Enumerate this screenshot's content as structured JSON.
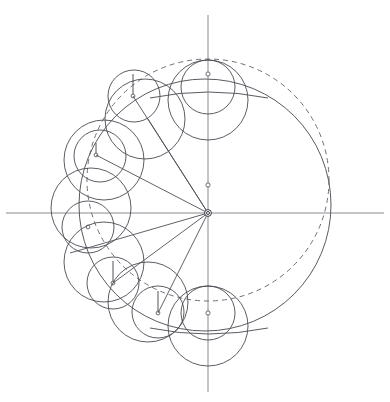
{
  "figure": {
    "canvas": {
      "width": 390,
      "height": 402
    },
    "origin": {
      "x": 208,
      "y": 213
    },
    "colors": {
      "axis": "#8a8a90",
      "dashed_guide": "#6f6f78",
      "solid_guide": "#5a5a62",
      "circle": "#4a4a52",
      "spoke": "#4f4f58",
      "background": "#ffffff"
    },
    "axes": {
      "x_axis": {
        "x1": 6,
        "y1": 213,
        "x2": 384,
        "y2": 213
      },
      "y_axis": {
        "x1": 208,
        "y1": 15,
        "x2": 208,
        "y2": 392
      }
    },
    "axis_marker_dot": {
      "x": 208,
      "y": 185,
      "r": 2.1
    },
    "origin_marker": {
      "x": 208,
      "y": 213,
      "r_outer": 3.4,
      "r_inner": 1.5
    },
    "dashed_guide_circle": {
      "cx": 208,
      "cy": 180,
      "r": 121,
      "style": "dashed"
    },
    "solid_guide_circle": {
      "cx": 205,
      "cy": 205,
      "r": 126,
      "style": "solid"
    },
    "rolling_circles": [
      {
        "id": "pos-0",
        "angle_deg": 90,
        "cx": 208,
        "cy": 100,
        "r": 40,
        "inner_cx": 208,
        "inner_cy": 87,
        "inner_r": 27,
        "dot_x": 208,
        "dot_y": 74,
        "radius_to_x": 208,
        "radius_to_y": 60
      },
      {
        "id": "pos-1",
        "angle_deg": 125,
        "cx": 145,
        "cy": 119,
        "r": 40,
        "inner_cx": 134,
        "inner_cy": 96,
        "inner_r": 26,
        "dot_x": 133,
        "dot_y": 96,
        "radius_to_x": 133,
        "radius_to_y": 74
      },
      {
        "id": "pos-2",
        "angle_deg": 155,
        "cx": 104,
        "cy": 160,
        "r": 40,
        "inner_cx": 100,
        "inner_cy": 156,
        "inner_r": 26,
        "dot_x": 96,
        "dot_y": 155,
        "radius_to_x": 96,
        "radius_to_y": 143
      },
      {
        "id": "pos-3",
        "angle_deg": 180,
        "cx": 91,
        "cy": 208,
        "r": 40,
        "inner_cx": 88,
        "inner_cy": 227,
        "inner_r": 26,
        "dot_x": 88,
        "dot_y": 227,
        "radius_to_x": 88,
        "radius_to_y": 227
      },
      {
        "id": "pos-4",
        "angle_deg": 205,
        "cx": 104,
        "cy": 262,
        "r": 40,
        "inner_cx": 113,
        "inner_cy": 283,
        "inner_r": 26,
        "dot_x": 113,
        "dot_y": 283,
        "radius_to_x": 113,
        "radius_to_y": 261
      },
      {
        "id": "pos-5",
        "angle_deg": 235,
        "cx": 148,
        "cy": 302,
        "r": 40,
        "inner_cx": 158,
        "inner_cy": 312,
        "inner_r": 26,
        "dot_x": 158,
        "dot_y": 313,
        "radius_to_x": 158,
        "radius_to_y": 291
      },
      {
        "id": "pos-6",
        "angle_deg": 270,
        "cx": 208,
        "cy": 326,
        "r": 40,
        "inner_cx": 208,
        "inner_cy": 313,
        "inner_r": 27,
        "dot_x": 208,
        "dot_y": 313,
        "radius_to_x": 208,
        "radius_to_y": 300
      }
    ],
    "spokes": [
      {
        "id": "spoke-upper-1",
        "x1": 208,
        "y1": 213,
        "x2": 133,
        "y2": 96
      },
      {
        "id": "spoke-upper-2",
        "x1": 208,
        "y1": 213,
        "x2": 96,
        "y2": 155
      },
      {
        "id": "spoke-lower-1",
        "x1": 208,
        "y1": 213,
        "x2": 113,
        "y2": 283
      },
      {
        "id": "spoke-lower-2",
        "x1": 208,
        "y1": 213,
        "x2": 158,
        "y2": 313
      },
      {
        "id": "spoke-tangent-upper",
        "x1": 208,
        "y1": 213,
        "x2": 148,
        "y2": 119
      }
    ],
    "tangent_chords": [
      {
        "id": "chord-top",
        "x1": 169,
        "y1": 94,
        "x2": 248,
        "y2": 94
      },
      {
        "id": "chord-bottom",
        "x1": 169,
        "y1": 331,
        "x2": 248,
        "y2": 331
      }
    ]
  }
}
